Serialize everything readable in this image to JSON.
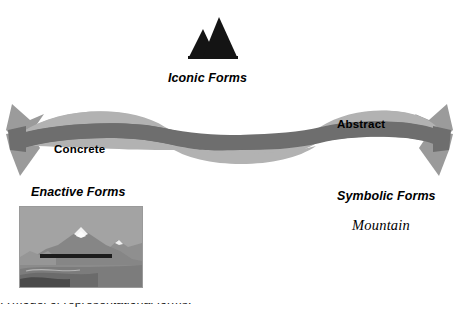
{
  "diagram": {
    "iconic": {
      "icon_name": "mountain-peaks-icon",
      "label": "Iconic Forms"
    },
    "enactive": {
      "label": "Enactive Forms",
      "photo_alt": "mountain-landscape-photo"
    },
    "symbolic": {
      "label": "Symbolic Forms",
      "word": "Mountain"
    },
    "ribbon": {
      "left_label": "Concrete",
      "right_label": "Abstract",
      "light_color": "#b0b0b0",
      "dark_color": "#6e6e6e",
      "arrow_color": "#8e8e8e"
    },
    "bottom_caption": "A model of representational forms."
  }
}
